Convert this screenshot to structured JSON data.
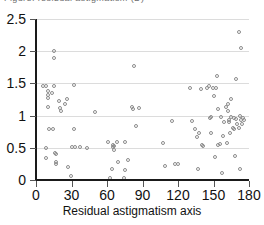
{
  "clipped_title": "Figure: residual astigmatism (D)",
  "chart_data": {
    "type": "scatter",
    "title": "",
    "xlabel": "Residual astigmatism axis",
    "ylabel": "",
    "xlim": [
      0,
      180
    ],
    "ylim": [
      0,
      2.5
    ],
    "xticks": [
      0,
      30,
      60,
      90,
      120,
      150,
      180
    ],
    "yticks": [
      0,
      0.5,
      1,
      1.5,
      2,
      2.5
    ],
    "xtick_labels": [
      "0",
      "30",
      "60",
      "90",
      "120",
      "150",
      "180"
    ],
    "ytick_labels": [
      "0",
      "0.5",
      "1",
      "1.5",
      "2",
      "2.5"
    ],
    "grid": "horizontal",
    "legend": "none",
    "marker": "open-circle",
    "marker_color": "#8c8c8c",
    "points": [
      [
        7,
        1.45
      ],
      [
        9,
        1.44
      ],
      [
        9,
        0.48
      ],
      [
        9,
        0.33
      ],
      [
        11,
        1.37
      ],
      [
        11,
        1.3
      ],
      [
        11,
        1.26
      ],
      [
        11,
        1.12
      ],
      [
        12,
        0.77
      ],
      [
        14,
        1.33
      ],
      [
        15,
        0.77
      ],
      [
        16,
        1.98
      ],
      [
        16,
        1.88
      ],
      [
        16,
        1.44
      ],
      [
        17,
        0.41
      ],
      [
        18,
        0.39
      ],
      [
        18,
        0.26
      ],
      [
        18,
        0.23
      ],
      [
        20,
        1.21
      ],
      [
        21,
        1.1
      ],
      [
        22,
        1.05
      ],
      [
        25,
        1.16
      ],
      [
        27,
        1.24
      ],
      [
        28,
        0.18
      ],
      [
        30,
        0.04
      ],
      [
        31,
        0.49
      ],
      [
        33,
        1.46
      ],
      [
        33,
        0.77
      ],
      [
        34,
        0.5
      ],
      [
        38,
        0.49
      ],
      [
        44,
        0.48
      ],
      [
        51,
        1.04
      ],
      [
        62,
        0.58
      ],
      [
        63,
        0.02
      ],
      [
        65,
        0.16
      ],
      [
        66,
        0.53
      ],
      [
        66,
        0.49
      ],
      [
        67,
        0.52
      ],
      [
        67,
        0.45
      ],
      [
        69,
        0.57
      ],
      [
        70,
        0.27
      ],
      [
        75,
        0.02
      ],
      [
        76,
        0.57
      ],
      [
        76,
        0.14
      ],
      [
        79,
        0.29
      ],
      [
        82,
        1.12
      ],
      [
        83,
        1.08
      ],
      [
        84,
        1.75
      ],
      [
        85,
        0.83
      ],
      [
        88,
        1.1
      ],
      [
        108,
        0.56
      ],
      [
        110,
        0.2
      ],
      [
        116,
        0.9
      ],
      [
        118,
        0.23
      ],
      [
        121,
        0.23
      ],
      [
        131,
        1.41
      ],
      [
        133,
        0.9
      ],
      [
        135,
        0.78
      ],
      [
        137,
        0.65
      ],
      [
        138,
        0.16
      ],
      [
        139,
        0.72
      ],
      [
        140,
        1.4
      ],
      [
        141,
        0.53
      ],
      [
        142,
        0.52
      ],
      [
        145,
        1.41
      ],
      [
        147,
        1.45
      ],
      [
        148,
        0.95
      ],
      [
        149,
        0.97
      ],
      [
        149,
        0.72
      ],
      [
        150,
        1.42
      ],
      [
        151,
        1.29
      ],
      [
        152,
        0.34
      ],
      [
        153,
        1.41
      ],
      [
        154,
        1.6
      ],
      [
        155,
        1.08
      ],
      [
        155,
        0.53
      ],
      [
        156,
        0.54
      ],
      [
        157,
        0.97
      ],
      [
        158,
        0.1
      ],
      [
        159,
        0.66
      ],
      [
        160,
        0.88
      ],
      [
        161,
        1.12
      ],
      [
        162,
        0.56
      ],
      [
        163,
        1.16
      ],
      [
        163,
        1.05
      ],
      [
        164,
        0.92
      ],
      [
        164,
        0.88
      ],
      [
        165,
        0.72
      ],
      [
        166,
        1.25
      ],
      [
        166,
        0.97
      ],
      [
        167,
        0.79
      ],
      [
        168,
        0.95
      ],
      [
        168,
        0.78
      ],
      [
        169,
        0.36
      ],
      [
        170,
        1.55
      ],
      [
        170,
        0.93
      ],
      [
        171,
        0.86
      ],
      [
        172,
        2.28
      ],
      [
        172,
        0.79
      ],
      [
        173,
        0.98
      ],
      [
        173,
        0.16
      ],
      [
        174,
        2.03
      ],
      [
        174,
        0.92
      ],
      [
        175,
        0.86
      ],
      [
        176,
        0.95
      ],
      [
        177,
        0.91
      ]
    ]
  }
}
